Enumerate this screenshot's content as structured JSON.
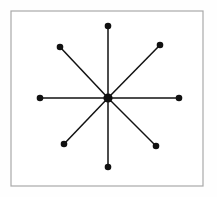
{
  "figure": {
    "panel": {
      "x": 11,
      "y": 11,
      "width": 192,
      "height": 175,
      "fill": "#ffffff",
      "stroke": "#a9a9a9",
      "stroke_width": 1.2
    },
    "colors": {
      "node": "#111111",
      "edge": "#111111",
      "panel_background": "#ffffff",
      "page_background": "#fefefe",
      "panel_border": "#a9a9a9"
    }
  },
  "chart_data": {
    "type": "scatter",
    "subtitle": "",
    "xlabel": "",
    "ylabel": "",
    "grid": false,
    "legend": "none",
    "xlim": [
      11,
      203
    ],
    "ylim": [
      11,
      186
    ],
    "hub": {
      "id": "center",
      "label": "center",
      "x": 108,
      "y": 98,
      "radius": 4.6
    },
    "nodes": [
      {
        "id": "n-up",
        "label": "up",
        "x": 108,
        "y": 26,
        "radius": 3.3,
        "angle_deg": 90
      },
      {
        "id": "n-upper-right",
        "label": "upper-right",
        "x": 160,
        "y": 45,
        "radius": 3.3,
        "angle_deg": 45
      },
      {
        "id": "n-right",
        "label": "right",
        "x": 179,
        "y": 98,
        "radius": 3.3,
        "angle_deg": 0
      },
      {
        "id": "n-lower-right",
        "label": "lower-right",
        "x": 156,
        "y": 146,
        "radius": 3.3,
        "angle_deg": 315
      },
      {
        "id": "n-down",
        "label": "down",
        "x": 108,
        "y": 167,
        "radius": 3.3,
        "angle_deg": 270
      },
      {
        "id": "n-lower-left",
        "label": "lower-left",
        "x": 64,
        "y": 144,
        "radius": 3.3,
        "angle_deg": 225
      },
      {
        "id": "n-left",
        "label": "left",
        "x": 40,
        "y": 98,
        "radius": 3.3,
        "angle_deg": 180
      },
      {
        "id": "n-upper-left",
        "label": "upper-left",
        "x": 60,
        "y": 47,
        "radius": 3.3,
        "angle_deg": 135
      }
    ],
    "edges": [
      {
        "id": "e-up",
        "from": "center",
        "to": "n-up",
        "x1": 108,
        "y1": 98,
        "x2": 108,
        "y2": 26
      },
      {
        "id": "e-upper-right",
        "from": "center",
        "to": "n-upper-right",
        "x1": 108,
        "y1": 98,
        "x2": 160,
        "y2": 45
      },
      {
        "id": "e-right",
        "from": "center",
        "to": "n-right",
        "x1": 108,
        "y1": 98,
        "x2": 179,
        "y2": 98
      },
      {
        "id": "e-lower-right",
        "from": "center",
        "to": "n-lower-right",
        "x1": 108,
        "y1": 98,
        "x2": 156,
        "y2": 146
      },
      {
        "id": "e-down",
        "from": "center",
        "to": "n-down",
        "x1": 108,
        "y1": 98,
        "x2": 108,
        "y2": 167
      },
      {
        "id": "e-lower-left",
        "from": "center",
        "to": "n-lower-left",
        "x1": 108,
        "y1": 98,
        "x2": 64,
        "y2": 144
      },
      {
        "id": "e-left",
        "from": "center",
        "to": "n-left",
        "x1": 108,
        "y1": 98,
        "x2": 40,
        "y2": 98
      },
      {
        "id": "e-upper-left",
        "from": "center",
        "to": "n-upper-left",
        "x1": 108,
        "y1": 98,
        "x2": 60,
        "y2": 47
      }
    ]
  }
}
